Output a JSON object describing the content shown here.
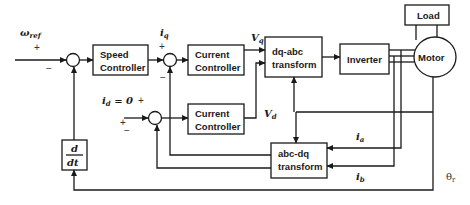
{
  "diagram": {
    "blocks": {
      "speed_controller": [
        "Speed",
        "Controller"
      ],
      "current_controller_q": [
        "Current",
        "Controller"
      ],
      "current_controller_d": [
        "Current",
        "Controller"
      ],
      "dq_abc": [
        "dq-abc",
        "transform"
      ],
      "inverter": "Inverter",
      "motor": "Motor",
      "load": "Load",
      "abc_dq": [
        "abc-dq",
        "transform"
      ],
      "derivative": {
        "num": "d",
        "den": "dt"
      }
    },
    "signals": {
      "omega_ref": "ω",
      "omega_ref_sub": "ref",
      "iq": "i",
      "iq_sub": "q",
      "id_eq": "i",
      "id_sub": "d",
      "id_value": " = 0",
      "vq": "V",
      "vq_sub": "q",
      "vd": "V",
      "vd_sub": "d",
      "ia": "i",
      "ia_sub": "a",
      "ib": "i",
      "ib_sub": "b",
      "theta": "θ",
      "theta_sub": "r"
    },
    "signs": {
      "plus": "+",
      "minus": "−"
    }
  }
}
